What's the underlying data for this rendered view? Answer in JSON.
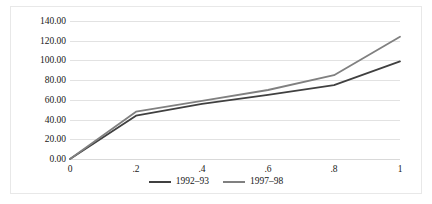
{
  "chart_data": {
    "type": "line",
    "title": "",
    "xlabel": "",
    "ylabel": "",
    "x": [
      0,
      0.2,
      0.4,
      0.6,
      0.8,
      1
    ],
    "x_tick_labels": [
      "0",
      ".2",
      ".4",
      ".6",
      ".8",
      "1"
    ],
    "y_tick_labels": [
      "0.00",
      "20.00",
      "40.00",
      "60.00",
      "80.00",
      "100.00",
      "120.00",
      "140.00"
    ],
    "y_tick_values": [
      0,
      20,
      40,
      60,
      80,
      100,
      120,
      140
    ],
    "ylim": [
      0,
      140
    ],
    "xlim": [
      0,
      1
    ],
    "grid": true,
    "legend_position": "bottom",
    "series": [
      {
        "name": "1992–93",
        "color": "#404040",
        "values": [
          0,
          44,
          56,
          65,
          75,
          99
        ]
      },
      {
        "name": "1997–98",
        "color": "#808080",
        "values": [
          0,
          48,
          59,
          70,
          85,
          124
        ]
      }
    ]
  },
  "colors": {
    "gridline": "#e2e2e2",
    "border": "#e8e8e8",
    "background": "#ffffff",
    "text": "#202020"
  }
}
